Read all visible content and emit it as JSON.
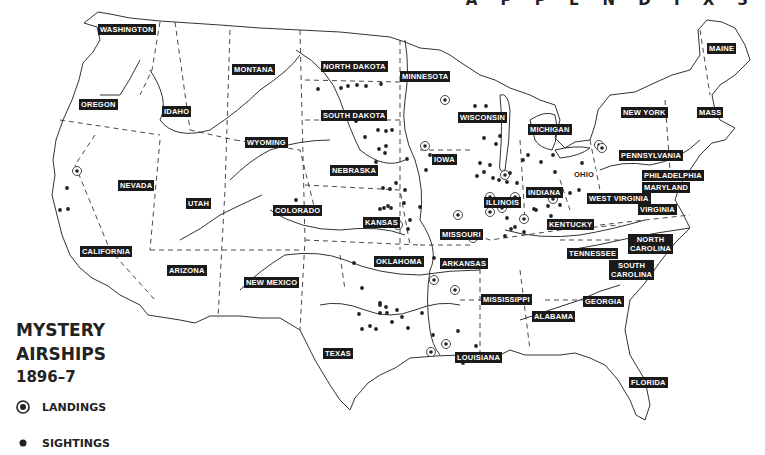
{
  "header": {
    "appendix_text": "A P P E N D I X  3"
  },
  "map": {
    "title_line1": "MYSTERY",
    "title_line2": "AIRSHIPS",
    "title_line3": "1896–7",
    "colors": {
      "ink": "#222222",
      "label_bg": "#1a1a1a",
      "label_text": "#ffffff",
      "background": "#ffffff"
    }
  },
  "legend": {
    "items": [
      {
        "symbol": "circled-dot-icon",
        "label": "LANDINGS"
      },
      {
        "symbol": "dot-icon",
        "label": "SIGHTINGS"
      }
    ]
  },
  "states": [
    {
      "name": "WASHINGTON",
      "x": 98,
      "y": 24
    },
    {
      "name": "MONTANA",
      "x": 232,
      "y": 64
    },
    {
      "name": "OREGON",
      "x": 79,
      "y": 99
    },
    {
      "name": "IDAHO",
      "x": 162,
      "y": 106
    },
    {
      "name": "WYOMING",
      "x": 245,
      "y": 137
    },
    {
      "name": "NORTH DAKOTA",
      "x": 321,
      "y": 61
    },
    {
      "name": "SOUTH DAKOTA",
      "x": 321,
      "y": 110
    },
    {
      "name": "MINNESOTA",
      "x": 400,
      "y": 71
    },
    {
      "name": "WISCONSIN",
      "x": 458,
      "y": 112
    },
    {
      "name": "MICHIGAN",
      "x": 528,
      "y": 124
    },
    {
      "name": "IOWA",
      "x": 432,
      "y": 154
    },
    {
      "name": "NEBRASKA",
      "x": 330,
      "y": 165
    },
    {
      "name": "NEVADA",
      "x": 118,
      "y": 180
    },
    {
      "name": "UTAH",
      "x": 186,
      "y": 198
    },
    {
      "name": "COLORADO",
      "x": 273,
      "y": 205
    },
    {
      "name": "KANSAS",
      "x": 363,
      "y": 217
    },
    {
      "name": "ILLINOIS",
      "x": 484,
      "y": 197
    },
    {
      "name": "INDIANA",
      "x": 526,
      "y": 187
    },
    {
      "name": "OHIO",
      "x": 572,
      "y": 169,
      "style": "plain"
    },
    {
      "name": "NEW YORK",
      "x": 621,
      "y": 107
    },
    {
      "name": "MASS",
      "x": 697,
      "y": 107
    },
    {
      "name": "PENNSYLVANIA",
      "x": 619,
      "y": 150
    },
    {
      "name": "PHILADELPHIA",
      "x": 642,
      "y": 170
    },
    {
      "name": "MARYLAND",
      "x": 642,
      "y": 182
    },
    {
      "name": "WEST VIRGINIA",
      "x": 587,
      "y": 193
    },
    {
      "name": "VIRGINIA",
      "x": 638,
      "y": 204
    },
    {
      "name": "KENTUCKY",
      "x": 547,
      "y": 219
    },
    {
      "name": "MISSOURI",
      "x": 440,
      "y": 229
    },
    {
      "name": "CALIFORNIA",
      "x": 80,
      "y": 246
    },
    {
      "name": "OKLAHOMA",
      "x": 374,
      "y": 256
    },
    {
      "name": "ARKANSAS",
      "x": 440,
      "y": 258
    },
    {
      "name": "TENNESSEE",
      "x": 567,
      "y": 248
    },
    {
      "name": "NORTH CAROLINA",
      "x": 628,
      "y": 234,
      "two_line": true
    },
    {
      "name": "SOUTH CAROLINA",
      "x": 609,
      "y": 260,
      "two_line": true
    },
    {
      "name": "ARIZONA",
      "x": 167,
      "y": 265
    },
    {
      "name": "NEW MEXICO",
      "x": 244,
      "y": 277
    },
    {
      "name": "MISSISSIPPI",
      "x": 481,
      "y": 294
    },
    {
      "name": "GEORGIA",
      "x": 583,
      "y": 296
    },
    {
      "name": "ALABAMA",
      "x": 532,
      "y": 311
    },
    {
      "name": "MAINE",
      "x": 707,
      "y": 43
    },
    {
      "name": "TEXAS",
      "x": 323,
      "y": 348
    },
    {
      "name": "LOUISIANA",
      "x": 455,
      "y": 352
    },
    {
      "name": "FLORIDA",
      "x": 629,
      "y": 377
    }
  ],
  "chart_data": {
    "type": "scatter",
    "legend": [
      "LANDINGS",
      "SIGHTINGS"
    ],
    "series": [
      {
        "name": "LANDINGS",
        "points": [
          [
            77,
            171
          ],
          [
            425,
            146
          ],
          [
            445,
            100
          ],
          [
            398,
            225
          ],
          [
            458,
            215
          ],
          [
            473,
            238
          ],
          [
            434,
            280
          ],
          [
            455,
            290
          ],
          [
            431,
            352
          ],
          [
            446,
            344
          ],
          [
            505,
            175
          ],
          [
            502,
            208
          ],
          [
            490,
            197
          ],
          [
            490,
            212
          ],
          [
            524,
            219
          ],
          [
            553,
            199
          ],
          [
            515,
            197
          ],
          [
            599,
            145
          ],
          [
            602,
            148
          ]
        ]
      },
      {
        "name": "SIGHTINGS",
        "points": [
          [
            318,
            89
          ],
          [
            341,
            88
          ],
          [
            348,
            86
          ],
          [
            357,
            85
          ],
          [
            366,
            86
          ],
          [
            381,
            84
          ],
          [
            356,
            121
          ],
          [
            378,
            130
          ],
          [
            386,
            131
          ],
          [
            392,
            130
          ],
          [
            385,
            153
          ],
          [
            376,
            162
          ],
          [
            365,
            137
          ],
          [
            386,
            146
          ],
          [
            379,
            149
          ],
          [
            407,
            159
          ],
          [
            430,
            155
          ],
          [
            426,
            170
          ],
          [
            396,
            183
          ],
          [
            405,
            190
          ],
          [
            390,
            189
          ],
          [
            383,
            188
          ],
          [
            296,
            200
          ],
          [
            380,
            209
          ],
          [
            384,
            208
          ],
          [
            388,
            206
          ],
          [
            391,
            208
          ],
          [
            404,
            203
          ],
          [
            420,
            207
          ],
          [
            410,
            220
          ],
          [
            408,
            229
          ],
          [
            354,
            263
          ],
          [
            362,
            288
          ],
          [
            380,
            303
          ],
          [
            408,
            328
          ],
          [
            433,
            335
          ],
          [
            458,
            331
          ],
          [
            476,
            346
          ],
          [
            463,
            363
          ],
          [
            422,
            313
          ],
          [
            359,
            314
          ],
          [
            380,
            305
          ],
          [
            386,
            307
          ],
          [
            397,
            310
          ],
          [
            402,
            317
          ],
          [
            362,
            329
          ],
          [
            370,
            326
          ],
          [
            380,
            313
          ],
          [
            392,
            322
          ],
          [
            387,
            313
          ],
          [
            376,
            329
          ],
          [
            434,
            258
          ],
          [
            447,
            260
          ],
          [
            475,
            106
          ],
          [
            486,
            106
          ],
          [
            498,
            120
          ],
          [
            500,
            136
          ],
          [
            496,
            144
          ],
          [
            484,
            138
          ],
          [
            480,
            163
          ],
          [
            490,
            165
          ],
          [
            484,
            172
          ],
          [
            477,
            176
          ],
          [
            507,
            182
          ],
          [
            517,
            183
          ],
          [
            510,
            173
          ],
          [
            523,
            160
          ],
          [
            528,
            155
          ],
          [
            541,
            162
          ],
          [
            553,
            155
          ],
          [
            582,
            163
          ],
          [
            579,
            190
          ],
          [
            555,
            172
          ],
          [
            570,
            193
          ],
          [
            548,
            206
          ],
          [
            560,
            205
          ],
          [
            551,
            216
          ],
          [
            534,
            209
          ],
          [
            524,
            232
          ],
          [
            511,
            229
          ],
          [
            507,
            218
          ],
          [
            515,
            227
          ],
          [
            505,
            236
          ],
          [
            536,
            210
          ],
          [
            503,
            203
          ],
          [
            499,
            180
          ],
          [
            493,
            178
          ],
          [
            67,
            188
          ],
          [
            60,
            210
          ],
          [
            68,
            209
          ]
        ]
      }
    ],
    "xlabel": "",
    "ylabel": ""
  }
}
